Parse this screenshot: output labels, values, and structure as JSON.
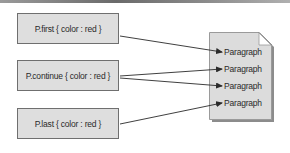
{
  "diagram": {
    "title": "",
    "selectors": [
      {
        "label": "P.first { color : red }",
        "top": 13
      },
      {
        "label": "P.continue { color : red }",
        "top": 60
      },
      {
        "label": "P.last { color : red }",
        "top": 108
      }
    ],
    "document": {
      "icon": "document-icon",
      "paragraphs": [
        {
          "label": "Paragraph",
          "y": 52
        },
        {
          "label": "Paragraph",
          "y": 69
        },
        {
          "label": "Paragraph",
          "y": 86
        },
        {
          "label": "Paragraph",
          "y": 103
        }
      ]
    },
    "connections": [
      {
        "from": "P.first",
        "to_paragraph": 1
      },
      {
        "from": "P.continue",
        "to_paragraph": 2
      },
      {
        "from": "P.continue",
        "to_paragraph": 3
      },
      {
        "from": "P.last",
        "to_paragraph": 4
      }
    ],
    "colors": {
      "box_fill": "#dedede",
      "box_border": "#6f6f6f",
      "doc_fill": "#dcdcdc",
      "line": "#2a2a2a"
    }
  }
}
